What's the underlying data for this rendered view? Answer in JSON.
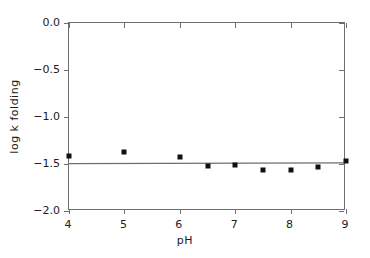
{
  "chart_data": {
    "type": "scatter",
    "title": "",
    "xlabel": "pH",
    "ylabel": "log k folding",
    "xlim": [
      4,
      9
    ],
    "ylim": [
      -2.0,
      0.0
    ],
    "grid": false,
    "legend": null,
    "xticks": [
      {
        "value": 4,
        "label": "4"
      },
      {
        "value": 5,
        "label": "5"
      },
      {
        "value": 6,
        "label": "6"
      },
      {
        "value": 7,
        "label": "7"
      },
      {
        "value": 8,
        "label": "8"
      },
      {
        "value": 9,
        "label": "9"
      }
    ],
    "yticks": [
      {
        "value": 0.0,
        "label": "0.0"
      },
      {
        "value": -0.5,
        "label": "-0.5"
      },
      {
        "value": -1.0,
        "label": "-1.0"
      },
      {
        "value": -1.5,
        "label": "-1.5"
      },
      {
        "value": -2.0,
        "label": "-2.0"
      }
    ],
    "x": [
      4.0,
      5.0,
      6.0,
      6.5,
      7.0,
      7.5,
      8.0,
      8.5,
      9.0
    ],
    "values": [
      -1.42,
      -1.37,
      -1.43,
      -1.52,
      -1.51,
      -1.56,
      -1.56,
      -1.53,
      -1.47
    ],
    "series": [
      {
        "name": "log k folding",
        "marker": "square",
        "color": "#101010",
        "points": [
          {
            "x": 4.0,
            "y": -1.42
          },
          {
            "x": 5.0,
            "y": -1.37
          },
          {
            "x": 6.0,
            "y": -1.43
          },
          {
            "x": 6.5,
            "y": -1.52
          },
          {
            "x": 7.0,
            "y": -1.51
          },
          {
            "x": 7.5,
            "y": -1.56
          },
          {
            "x": 8.0,
            "y": -1.56
          },
          {
            "x": 8.5,
            "y": -1.53
          },
          {
            "x": 9.0,
            "y": -1.47
          }
        ]
      }
    ],
    "fit_line": {
      "name": "horizontal fit",
      "color": "#6e6e6e",
      "x_start": 4.0,
      "y_start": -1.513,
      "x_end": 9.0,
      "y_end": -1.505
    }
  }
}
